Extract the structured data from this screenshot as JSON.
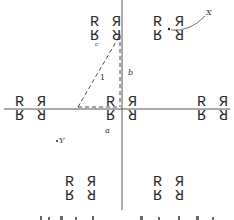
{
  "figure": {
    "motif": {
      "top_left": "R",
      "top_right": "Я",
      "bottom_left": "R (inverted)",
      "bottom_right": "Я (inverted)"
    },
    "glyphs": {
      "r": "R",
      "r_mirror": "Я"
    },
    "labels": {
      "x_point": "X",
      "y_point": "Y",
      "side_a": "a",
      "side_b": "b",
      "side_c": "c",
      "angle_1": "1"
    },
    "caption_partial": "(caption cut off at bottom edge)"
  },
  "motif_positions": [
    {
      "id": "motif-top-left",
      "x": 105,
      "y": 28
    },
    {
      "id": "motif-top-right",
      "x": 165,
      "y": 28
    },
    {
      "id": "motif-mid-left",
      "x": 28,
      "y": 108
    },
    {
      "id": "motif-center",
      "x": 120,
      "y": 108
    },
    {
      "id": "motif-mid-right",
      "x": 210,
      "y": 108
    },
    {
      "id": "motif-bottom-left",
      "x": 80,
      "y": 185
    },
    {
      "id": "motif-bottom-right",
      "x": 165,
      "y": 185
    }
  ],
  "colors": {
    "ink": "#2b2b2b",
    "background": "#ffffff"
  }
}
